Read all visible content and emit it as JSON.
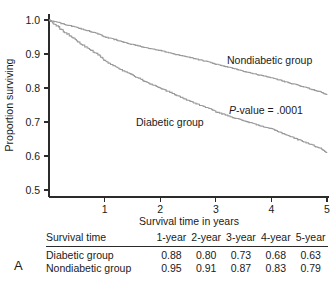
{
  "panel": {
    "letter": "A"
  },
  "chart_data": {
    "type": "line",
    "title": "",
    "xlabel": "Survival time in years",
    "ylabel": "Proportion surviving",
    "xlim": [
      0,
      5
    ],
    "ylim": [
      0.5,
      1.0
    ],
    "xticks": [
      1,
      2,
      3,
      4,
      5
    ],
    "xtick_labels": [
      "1",
      "2",
      "3",
      "4",
      "5"
    ],
    "yticks": [
      0.5,
      0.6,
      0.7,
      0.8,
      0.9,
      1.0
    ],
    "ytick_labels": [
      "0.5",
      "0.6",
      "0.7",
      "0.8",
      "0.9",
      "1.0"
    ],
    "grid": false,
    "legend_position": "inline-annotation",
    "annotations": [
      {
        "name": "p-value",
        "text_italic": "P",
        "text": "-value = .0001"
      }
    ],
    "series": [
      {
        "name": "Nondiabetic group",
        "label": "Nondiabetic group",
        "color": "#9a9a9a",
        "x": [
          0,
          0.15,
          0.3,
          0.45,
          0.6,
          0.75,
          0.9,
          1.0,
          1.15,
          1.3,
          1.45,
          1.6,
          1.75,
          1.9,
          2.0,
          2.15,
          2.3,
          2.45,
          2.6,
          2.75,
          2.9,
          3.0,
          3.15,
          3.3,
          3.45,
          3.6,
          3.75,
          3.9,
          4.0,
          4.15,
          4.3,
          4.45,
          4.6,
          4.75,
          4.9,
          5.0
        ],
        "y": [
          1.0,
          0.993,
          0.986,
          0.98,
          0.973,
          0.966,
          0.958,
          0.95,
          0.944,
          0.937,
          0.93,
          0.924,
          0.918,
          0.913,
          0.91,
          0.904,
          0.898,
          0.893,
          0.887,
          0.881,
          0.875,
          0.87,
          0.864,
          0.858,
          0.851,
          0.845,
          0.839,
          0.834,
          0.83,
          0.823,
          0.816,
          0.809,
          0.802,
          0.795,
          0.787,
          0.78
        ]
      },
      {
        "name": "Diabetic group",
        "label": "Diabetic group",
        "color": "#9a9a9a",
        "x": [
          0,
          0.15,
          0.3,
          0.45,
          0.6,
          0.75,
          0.9,
          1.0,
          1.15,
          1.3,
          1.45,
          1.6,
          1.75,
          1.9,
          2.0,
          2.15,
          2.3,
          2.45,
          2.6,
          2.75,
          2.9,
          3.0,
          3.15,
          3.3,
          3.45,
          3.6,
          3.75,
          3.9,
          4.0,
          4.15,
          4.3,
          4.45,
          4.6,
          4.75,
          4.9,
          5.0
        ],
        "y": [
          1.0,
          0.981,
          0.962,
          0.945,
          0.927,
          0.911,
          0.896,
          0.88,
          0.866,
          0.853,
          0.841,
          0.829,
          0.817,
          0.807,
          0.8,
          0.789,
          0.778,
          0.767,
          0.757,
          0.747,
          0.739,
          0.73,
          0.722,
          0.714,
          0.706,
          0.699,
          0.691,
          0.684,
          0.68,
          0.67,
          0.66,
          0.65,
          0.641,
          0.631,
          0.621,
          0.61
        ]
      }
    ]
  },
  "table": {
    "header": [
      "Survival time",
      "1-year",
      "2-year",
      "3-year",
      "4-year",
      "5-year"
    ],
    "rows": [
      {
        "label": "Diabetic group",
        "values": [
          "0.88",
          "0.80",
          "0.73",
          "0.68",
          "0.63"
        ]
      },
      {
        "label": "Nondiabetic group",
        "values": [
          "0.95",
          "0.91",
          "0.87",
          "0.83",
          "0.79"
        ]
      }
    ]
  }
}
